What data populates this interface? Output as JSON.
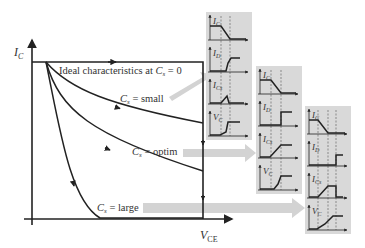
{
  "main_plot": {
    "y_axis_label": "I",
    "y_axis_sub": "C",
    "x_axis_label": "V",
    "x_axis_sub": "CE",
    "curves": [
      {
        "id": "ideal",
        "label_prefix": "Ideal characteristics at ",
        "label_var": "C",
        "label_sub": "s",
        "label_suffix": " = 0"
      },
      {
        "id": "small",
        "label_var": "C",
        "label_sub": "s",
        "label_suffix": " = small"
      },
      {
        "id": "optim",
        "label_var": "C",
        "label_sub": "s",
        "label_suffix": " = optim"
      },
      {
        "id": "large",
        "label_var": "C",
        "label_sub": "s",
        "label_suffix": " = large"
      }
    ]
  },
  "waveform_panels": [
    {
      "id": "small",
      "signals": [
        {
          "var": "I",
          "sub": "C"
        },
        {
          "var": "I",
          "sub": "D"
        },
        {
          "var": "I",
          "sub": "Cs"
        },
        {
          "var": "V",
          "sub": "C"
        }
      ]
    },
    {
      "id": "optim",
      "signals": [
        {
          "var": "I",
          "sub": "C"
        },
        {
          "var": "I",
          "sub": "D"
        },
        {
          "var": "I",
          "sub": "Cs"
        },
        {
          "var": "V",
          "sub": "C"
        }
      ]
    },
    {
      "id": "large",
      "signals": [
        {
          "var": "I",
          "sub": "C"
        },
        {
          "var": "I",
          "sub": "D"
        },
        {
          "var": "I",
          "sub": "Cs"
        },
        {
          "var": "V",
          "sub": "C"
        }
      ]
    }
  ],
  "colors": {
    "line": "#222222",
    "panel_bg": "#d9d9d9",
    "arrow": "#d0d0d0",
    "dashed": "#555555"
  }
}
